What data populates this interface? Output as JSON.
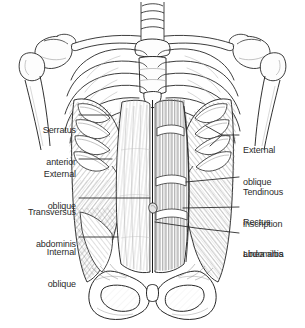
{
  "figure": {
    "view": "anterior",
    "background_color": "#ffffff",
    "ink_color": "#1a1a1a",
    "label_color": "#2b2b2b",
    "shade_color": "#a8a8a8",
    "style": "black-and-white pen-and-ink anatomical line drawing with hatched shading"
  },
  "labels": {
    "left": [
      {
        "id": "serratus-anterior",
        "text": "Serratus\nanterior",
        "line1": "Serratus",
        "line2": "anterior",
        "side": "left",
        "x": 14,
        "y": 104,
        "width": 62,
        "leader_from": [
          79,
          115
        ],
        "leader_to": [
          110,
          115
        ]
      },
      {
        "id": "external-oblique-left",
        "text": "External\noblique",
        "line1": "External",
        "line2": "oblique",
        "side": "left",
        "x": 14,
        "y": 148,
        "width": 62,
        "leader_from": [
          79,
          159
        ],
        "leader_to": [
          112,
          159
        ]
      },
      {
        "id": "transversus-abdominis",
        "text": "Transversus\nabdominis",
        "line1": "Transversus",
        "line2": "abdominis",
        "side": "left",
        "x": 6,
        "y": 186,
        "width": 70,
        "leader_from": [
          79,
          198
        ],
        "leader_to": [
          150,
          198
        ]
      },
      {
        "id": "internal-oblique",
        "text": "Internal\noblique",
        "line1": "Internal",
        "line2": "oblique",
        "side": "left",
        "x": 14,
        "y": 226,
        "width": 62,
        "leader_from": [
          79,
          237
        ],
        "leader_to": [
          118,
          237
        ]
      }
    ],
    "right": [
      {
        "id": "external-oblique-right",
        "text": "External\noblique",
        "line1": "External",
        "line2": "oblique",
        "side": "right",
        "x": 243,
        "y": 124,
        "width": 60,
        "leader_from": [
          239,
          135
        ],
        "leader_to": [
          206,
          126
        ],
        "leader_to_2": [
          210,
          146
        ]
      },
      {
        "id": "tendinous-inscription",
        "text": "Tendinous\ninscription",
        "line1": "Tendinous",
        "line2": "inscription",
        "side": "right",
        "x": 243,
        "y": 166,
        "width": 62,
        "leader_from": [
          239,
          177
        ],
        "leader_to": [
          186,
          182
        ]
      },
      {
        "id": "rectus-abdominis",
        "text": "Rectus\nabdominis",
        "line1": "Rectus",
        "line2": "abdominis",
        "side": "right",
        "x": 243,
        "y": 196,
        "width": 62,
        "leader_from": [
          239,
          207
        ],
        "leader_to": [
          183,
          208
        ]
      },
      {
        "id": "linea-alba",
        "text": "Linea alba",
        "line1": "Linea alba",
        "line2": "",
        "side": "right",
        "x": 243,
        "y": 228,
        "width": 60,
        "leader_from": [
          239,
          233
        ],
        "leader_to": [
          155,
          222
        ]
      }
    ]
  },
  "structures": [
    {
      "id": "clavicle-left",
      "name": "Left clavicle"
    },
    {
      "id": "clavicle-right",
      "name": "Right clavicle"
    },
    {
      "id": "scapula-left",
      "name": "Left scapula"
    },
    {
      "id": "scapula-right",
      "name": "Right scapula"
    },
    {
      "id": "humerus-left",
      "name": "Left humerus"
    },
    {
      "id": "humerus-right",
      "name": "Right humerus"
    },
    {
      "id": "sternum",
      "name": "Sternum with manubrium and xiphoid process"
    },
    {
      "id": "ribcage",
      "name": "Thoracic ribcage with costal cartilages"
    },
    {
      "id": "vertebrae",
      "name": "Cervical vertebrae"
    },
    {
      "id": "pelvis",
      "name": "Pelvis with iliac crests and obturator foramina"
    },
    {
      "id": "pubic-symphysis",
      "name": "Pubic symphysis"
    },
    {
      "id": "rectus-sheath",
      "name": "Anterior rectus sheath aponeurosis"
    }
  ]
}
